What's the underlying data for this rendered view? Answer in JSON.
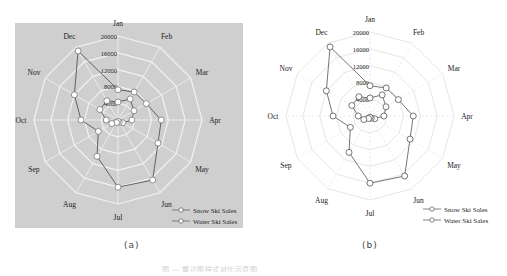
{
  "chart_data": [
    {
      "type": "radar",
      "panel": "a",
      "style": "gray-background",
      "background_color": "#cfcfcf",
      "grid_color": "#f2f2f2",
      "categories": [
        "Jan",
        "Feb",
        "Mar",
        "Apr",
        "May",
        "Jun",
        "Jul",
        "Aug",
        "Sep",
        "Oct",
        "Nov",
        "Dec"
      ],
      "radial_ticks": [
        "0",
        "4000",
        "8000",
        "12000",
        "16000",
        "20000"
      ],
      "rmax": 20000,
      "series": [
        {
          "name": "Snow Ski Sales",
          "values": [
            7200,
            7700,
            7800,
            10300,
            11000,
            16500,
            16000,
            10000,
            5400,
            8800,
            12000,
            19000
          ]
        },
        {
          "name": "Water Ski Sales",
          "values": [
            4300,
            5800,
            4400,
            3300,
            1300,
            600,
            300,
            700,
            1700,
            2800,
            5000,
            5300
          ]
        }
      ],
      "legend": {
        "position": "lower-right",
        "entries": [
          "Snow Ski Sales",
          "Water Ski Sales"
        ]
      },
      "label": "(a)"
    },
    {
      "type": "radar",
      "panel": "b",
      "style": "white-background",
      "background_color": "#ffffff",
      "grid_color": "#e6e6e6",
      "categories": [
        "Jan",
        "Feb",
        "Mar",
        "Apr",
        "May",
        "Jun",
        "Jul",
        "Aug",
        "Sep",
        "Oct",
        "Nov",
        "Dec"
      ],
      "radial_ticks": [
        "0",
        "4000",
        "8000",
        "12000",
        "16000",
        "20000"
      ],
      "rmax": 20000,
      "series": [
        {
          "name": "Snow Ski Sales",
          "values": [
            7200,
            7700,
            7800,
            10300,
            11000,
            16500,
            16000,
            10000,
            5400,
            8800,
            12000,
            19000
          ]
        },
        {
          "name": "Water Ski Sales",
          "values": [
            4300,
            5800,
            4400,
            3300,
            1300,
            600,
            300,
            700,
            1700,
            2800,
            5000,
            5300
          ]
        }
      ],
      "legend": {
        "position": "lower-right",
        "entries": [
          "Snow Ski Sales",
          "Water Ski Sales"
        ]
      },
      "label": "(b)"
    }
  ],
  "labels": {
    "sub_a": "(a)",
    "sub_b": "(b)",
    "caption": "图 — 雷达图样式对比示意图"
  }
}
